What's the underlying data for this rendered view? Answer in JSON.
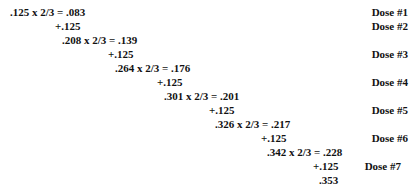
{
  "lines": [
    {
      "text": ".125 x 2/3 = .083",
      "x": 10,
      "y": 6
    },
    {
      "text": "+.125",
      "x": 55,
      "y": 20
    },
    {
      "text": ".208 x 2/3 = .139",
      "x": 62,
      "y": 34
    },
    {
      "text": "+.125",
      "x": 108,
      "y": 48
    },
    {
      "text": ".264 x 2/3 = .176",
      "x": 115,
      "y": 62
    },
    {
      "text": "+.125",
      "x": 157,
      "y": 76
    },
    {
      "text": ".301 x 2/3 = .201",
      "x": 164,
      "y": 90
    },
    {
      "text": "+.125",
      "x": 209,
      "y": 104
    },
    {
      "text": ".326 x 2/3 = .217",
      "x": 215,
      "y": 118
    },
    {
      "text": "+.125",
      "x": 261,
      "y": 132
    },
    {
      "text": ".342 x 2/3 = .228",
      "x": 267,
      "y": 146
    },
    {
      "text": "+.125",
      "x": 313,
      "y": 160
    },
    {
      "text": ".353",
      "x": 319,
      "y": 174
    }
  ],
  "doses": [
    {
      "label": "Dose #1",
      "y": 6
    },
    {
      "label": "Dose #2",
      "y": 20
    },
    {
      "label": "Dose #3",
      "y": 48
    },
    {
      "label": "Dose #4",
      "y": 76
    },
    {
      "label": "Dose #5",
      "y": 104
    },
    {
      "label": "Dose #6",
      "y": 132
    },
    {
      "label": "Dose #7",
      "y": 160
    }
  ]
}
